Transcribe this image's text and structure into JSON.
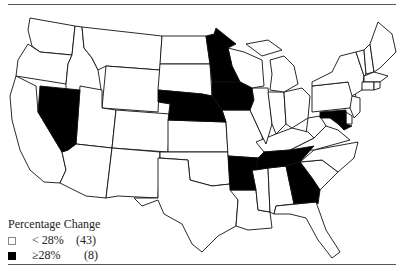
{
  "map": {
    "type": "choropleth",
    "region": "United States",
    "colors": {
      "low": "#ffffff",
      "high": "#000000",
      "stroke": "#111111"
    },
    "shaded_states": [
      "Nevada",
      "Nebraska",
      "Minnesota",
      "Iowa",
      "Arkansas",
      "Tennessee",
      "Georgia",
      "Maryland"
    ]
  },
  "legend": {
    "title": "Percentage Change",
    "items": [
      {
        "label": "< 28%",
        "count": "(43)",
        "color": "#ffffff"
      },
      {
        "label": "≥28%",
        "count": "(8)",
        "color": "#000000"
      }
    ]
  }
}
